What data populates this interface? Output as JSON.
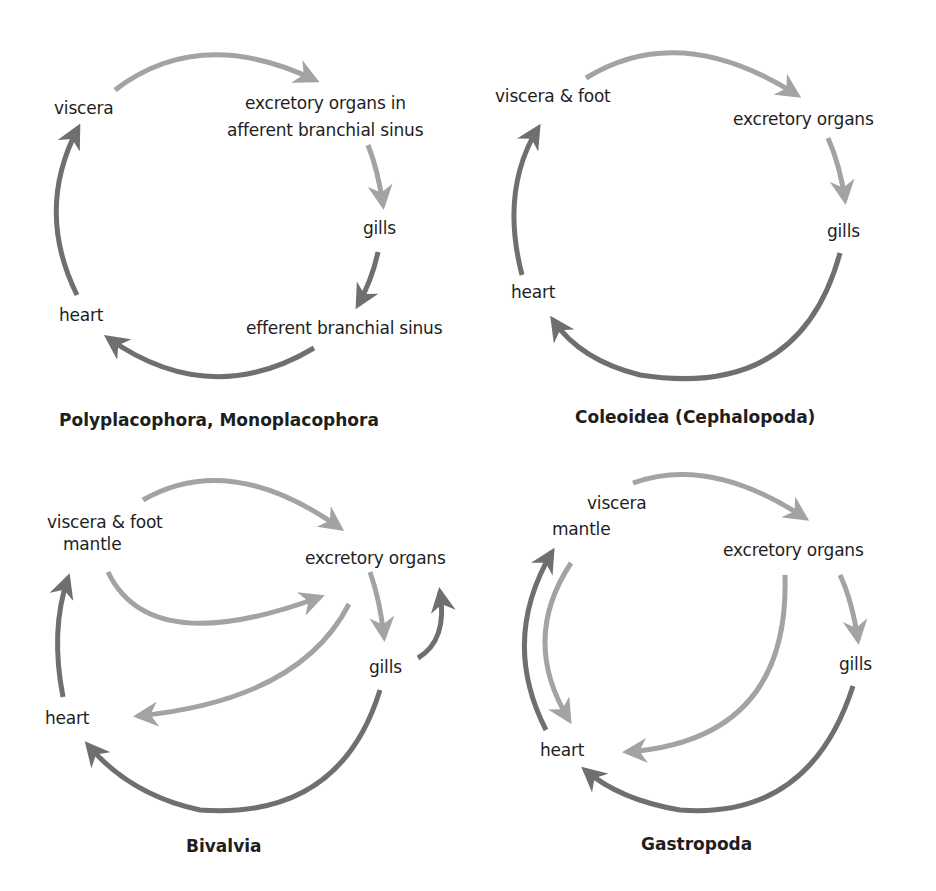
{
  "colors": {
    "light_arrow": "#a3a3a3",
    "dark_arrow": "#6f6f6f",
    "text": "#1e1e1e",
    "background": "#ffffff"
  },
  "panels": [
    {
      "title": "Polyplacophora, Monoplacophora",
      "labels": {
        "viscera": "viscera",
        "excretory": "excretory organs in",
        "excretory_2": "afferent branchial sinus",
        "gills": "gills",
        "efferent": "efferent branchial sinus",
        "heart": "heart"
      },
      "flows": [
        {
          "from": "viscera",
          "to": "excretory organs in afferent branchial sinus",
          "shade": "light"
        },
        {
          "from": "excretory organs in afferent branchial sinus",
          "to": "gills",
          "shade": "light"
        },
        {
          "from": "gills",
          "to": "efferent branchial sinus",
          "shade": "dark"
        },
        {
          "from": "efferent branchial sinus",
          "to": "heart",
          "shade": "dark"
        },
        {
          "from": "heart",
          "to": "viscera",
          "shade": "dark"
        }
      ]
    },
    {
      "title": "Coleoidea (Cephalopoda)",
      "labels": {
        "viscera": "viscera & foot",
        "excretory": "excretory organs",
        "gills": "gills",
        "heart": "heart"
      },
      "flows": [
        {
          "from": "viscera & foot",
          "to": "excretory organs",
          "shade": "light"
        },
        {
          "from": "excretory organs",
          "to": "gills",
          "shade": "light"
        },
        {
          "from": "gills",
          "to": "heart",
          "shade": "dark"
        },
        {
          "from": "heart",
          "to": "viscera & foot",
          "shade": "dark"
        }
      ]
    },
    {
      "title": "Bivalvia",
      "labels": {
        "viscera": "viscera & foot",
        "mantle": "mantle",
        "excretory": "excretory organs",
        "gills": "gills",
        "heart": "heart"
      },
      "flows": [
        {
          "from": "viscera & foot",
          "to": "excretory organs",
          "shade": "light"
        },
        {
          "from": "mantle",
          "to": "excretory organs",
          "shade": "light"
        },
        {
          "from": "excretory organs",
          "to": "gills",
          "shade": "light"
        },
        {
          "from": "excretory organs",
          "to": "heart",
          "shade": "light"
        },
        {
          "from": "gills",
          "to": "excretory organs",
          "shade": "dark"
        },
        {
          "from": "gills",
          "to": "heart",
          "shade": "dark"
        },
        {
          "from": "heart",
          "to": "viscera & foot / mantle",
          "shade": "dark"
        }
      ]
    },
    {
      "title": "Gastropoda",
      "labels": {
        "viscera": "viscera",
        "mantle": "mantle",
        "excretory": "excretory organs",
        "gills": "gills",
        "heart": "heart"
      },
      "flows": [
        {
          "from": "viscera",
          "to": "excretory organs",
          "shade": "light"
        },
        {
          "from": "excretory organs",
          "to": "gills",
          "shade": "light"
        },
        {
          "from": "excretory organs",
          "to": "heart",
          "shade": "light"
        },
        {
          "from": "mantle",
          "to": "heart",
          "shade": "light"
        },
        {
          "from": "gills",
          "to": "heart",
          "shade": "dark"
        },
        {
          "from": "heart",
          "to": "mantle",
          "shade": "dark"
        }
      ]
    }
  ]
}
